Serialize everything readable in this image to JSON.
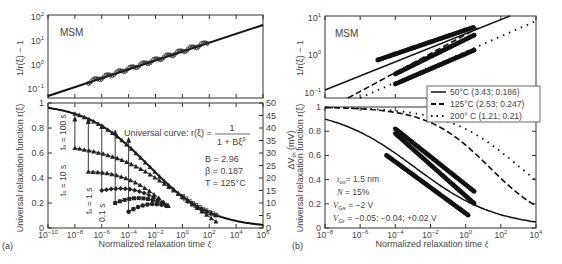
{
  "chart_data": [
    {
      "panel": "a-top",
      "type": "scatter",
      "label": "MSM",
      "ylabel": "1/r(ξ) − 1",
      "yscale": "log",
      "ylim": [
        0.03,
        100
      ],
      "yticks": [
        "10^-1",
        "10^0",
        "10^1",
        "10^2"
      ],
      "xscale": "log",
      "xlim": [
        1e-10,
        1000000.0
      ],
      "series": [
        {
          "name": "fit",
          "kind": "line",
          "x": [
            1e-10,
            1000000.0
          ],
          "y": [
            0.04,
            40
          ]
        },
        {
          "name": "data",
          "kind": "markers",
          "x_range": [
            1e-07,
            100.0
          ],
          "y_range": [
            0.1,
            7
          ]
        }
      ]
    },
    {
      "panel": "a-bottom",
      "type": "scatter",
      "ylabel": "Universal relaxation function r(ξ)",
      "y2label": "ΔV_th (mV)",
      "xlabel": "Normalized relaxation time ξ",
      "xscale": "log",
      "xlim": [
        1e-10,
        1000000.0
      ],
      "xticks": [
        "10^-10",
        "10^-8",
        "10^-6",
        "10^-4",
        "10^-2",
        "10^0",
        "10^2",
        "10^4",
        "10^6"
      ],
      "ylim": [
        0,
        1
      ],
      "yticks": [
        "0",
        "0.2",
        "0.4",
        "0.6",
        "0.8",
        "1"
      ],
      "y2lim": [
        0,
        50
      ],
      "y2ticks": [
        "0",
        "5",
        "10",
        "15",
        "20",
        "25",
        "30",
        "35",
        "40",
        "45",
        "50"
      ],
      "annotations": {
        "curve_label": "Universal curve: r(ξ) =",
        "numerator": "1",
        "denominator": "1 + Bξ^β",
        "B": "B = 2.96",
        "beta": "β = 0.187",
        "T": "T = 125°C",
        "stress_times": [
          "t_s = 100 s",
          "t_s = 10 s",
          "t_s = 1 s",
          "0.1 s"
        ]
      },
      "series": [
        {
          "name": "universal curve",
          "kind": "line",
          "B": 2.96,
          "beta": 0.187
        },
        {
          "name": "ts=100s",
          "x_start": 1e-08,
          "r_start": 0.9
        },
        {
          "name": "ts=10s",
          "x_start": 1e-08,
          "r_start": 0.64
        },
        {
          "name": "ts=1s",
          "x_start": 1e-07,
          "r_start": 0.45
        },
        {
          "name": "ts=0.1s",
          "x_start": 1e-06,
          "r_start": 0.3
        }
      ],
      "panel_label": "(a)"
    },
    {
      "panel": "b-top",
      "type": "scatter",
      "label": "MSM",
      "ylabel": "1/r(ξ) − 1",
      "yscale": "log",
      "ylim": [
        0.05,
        10
      ],
      "yticks": [
        "10^-1",
        "10^0",
        "10^1"
      ],
      "legend": [
        {
          "style": "solid",
          "label": "50°C (3.43; 0.186)"
        },
        {
          "style": "dashed",
          "label": "125°C (2.53; 0.247)"
        },
        {
          "style": "dotted",
          "label": "200° C (1.21; 0.21)"
        }
      ]
    },
    {
      "panel": "b-bottom",
      "type": "scatter",
      "ylabel": "Universal relaxation function r(ξ)",
      "y2label": "ΔV_th (mV)",
      "xlabel": "Normalized relaxation time ξ",
      "xscale": "log",
      "xlim": [
        1e-08,
        10000.0
      ],
      "xticks": [
        "10^-8",
        "10^-6",
        "10^-4",
        "10^-2",
        "10^0",
        "10^2",
        "10^4"
      ],
      "ylim": [
        0,
        1
      ],
      "yticks": [
        "0",
        "0.2",
        "0.4",
        "0.6",
        "0.8",
        "1"
      ],
      "annotations": [
        "t_ox = 1.5 nm",
        "N = 15%",
        "V_Gs = −2 V",
        "V_Gr = −0.05; −0.04; +0.02 V"
      ],
      "series": [
        {
          "name": "50°C",
          "B": 3.43,
          "beta": 0.186,
          "style": "solid"
        },
        {
          "name": "125°C",
          "B": 2.53,
          "beta": 0.247,
          "style": "dashed"
        },
        {
          "name": "200°C",
          "B": 1.21,
          "beta": 0.21,
          "style": "dotted"
        }
      ],
      "panel_label": "(b)"
    }
  ],
  "labels": {
    "msm": "MSM",
    "panel_a": "(a)",
    "panel_b": "(b)",
    "xlabel": "Normalized relaxation time ",
    "xi": "ξ",
    "ylabel_top": "1/r(ξ) − 1",
    "ylabel_bottom": "Universal relaxation function r(ξ)",
    "y2label": "ΔV",
    "y2label_sub": "th",
    "y2label_unit": " (mV)",
    "curve_label": "Universal curve: r(ξ) =",
    "numerator": "1",
    "denominator": "1 + Bξ",
    "denominator_exp": "β",
    "B": "B = 2.96",
    "beta": "β = 0.187",
    "T": "T = 125°C",
    "ts100": "t",
    "ts100_rest": " = 100 s",
    "ts10_rest": " = 10 s",
    "ts1_rest": " = 1 s",
    "ts01": "0.1 s",
    "tox": "= 1.5 nm",
    "N": "N",
    "N_rest": " = 15%",
    "vgs_rest": " = −2 V",
    "vgr_rest": " = −0.05; −0.04; +0.02 V",
    "legend_50": "50°C (3.43; 0.186)",
    "legend_125": "125°C (2.53; 0.247)",
    "legend_200": "200° C (1.21; 0.21)"
  }
}
